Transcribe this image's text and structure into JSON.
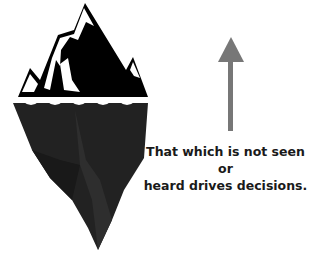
{
  "diagram": {
    "caption": {
      "line1": "That which is not seen or",
      "line2": "heard drives decisions."
    },
    "elements": {
      "iceberg_icon": "iceberg-icon",
      "waterline_icon": "wave-icon",
      "arrow_icon": "arrow-up-icon"
    },
    "colors": {
      "iceberg_top": "#000000",
      "iceberg_underwater": "#222222",
      "iceberg_underwater_shade": "#2e2e2e",
      "snow": "#ffffff",
      "arrow": "#777777",
      "text": "#1a1a1a"
    }
  }
}
